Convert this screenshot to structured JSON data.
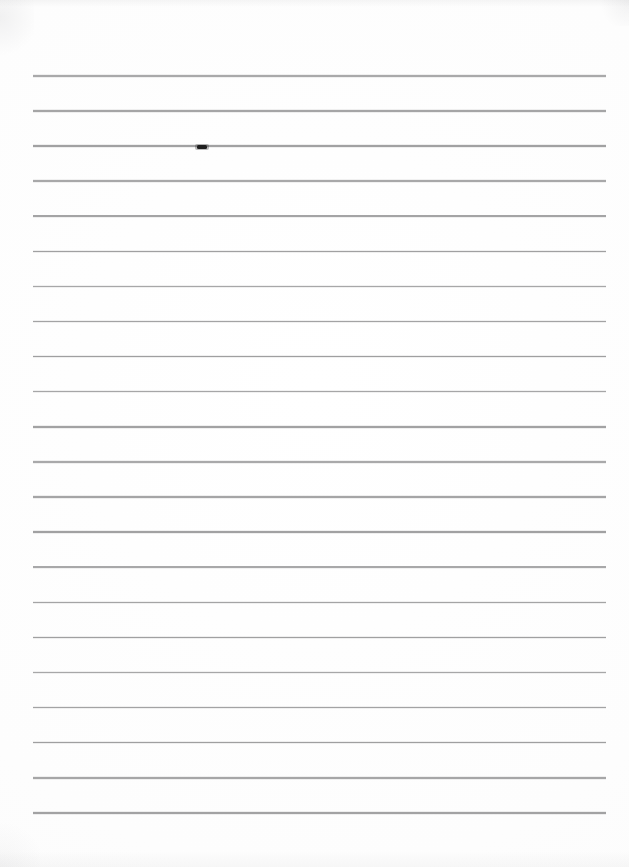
{
  "document": {
    "kind": "scanned-lined-paper",
    "title": "Blank ruled notebook page",
    "visible_text": "",
    "page_width_px": 629,
    "page_height_px": 867,
    "background_color": "#fefefe",
    "paper_tone_color": "#fdfdfd"
  },
  "ruling": {
    "line_color": "#9c9c9e",
    "line_thickness_px": 1.6,
    "line_count": 22,
    "line_left_px": 33,
    "line_right_px": 606,
    "line_length_px": 573,
    "first_line_y_px": 75,
    "last_line_y_px": 812,
    "line_spacing_px": 35.1,
    "has_vertical_margin_rule": false,
    "line_y_positions_px": [
      75,
      110.1,
      145.2,
      180.3,
      215.4,
      250.5,
      285.6,
      320.7,
      355.8,
      390.9,
      426,
      461.1,
      496.2,
      531.3,
      566.4,
      601.5,
      636.6,
      671.7,
      706.8,
      741.9,
      777,
      812.1
    ]
  },
  "annotations": {
    "ink_marks": [
      {
        "label": "ink-smudge",
        "description": "small dark pen stroke on third ruled line",
        "x_px": 197,
        "y_px": 145,
        "width_px": 10,
        "height_px": 3.5,
        "color": "#1b1b1b",
        "on_line_index": 3
      }
    ]
  },
  "scan_artifacts": {
    "top_edge_shadow": true,
    "bottom_edge_shadow": true,
    "corner_vignette_top_left": true,
    "corner_vignette_top_right": true,
    "corner_vignette_bottom_left": true,
    "shadow_color": "#8c8c91"
  }
}
